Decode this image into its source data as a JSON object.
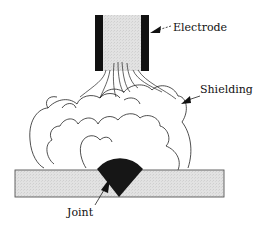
{
  "diagram": {
    "type": "welding-process-schematic",
    "labels": {
      "electrode": "Electrode",
      "shielding": "Shielding",
      "joint": "Joint"
    },
    "colors": {
      "electrode_walls": "#111111",
      "electrode_core": "#d8d8d8",
      "plate_fill": "#e4e4e4",
      "plate_stroke": "#555555",
      "weld_bead": "#161616",
      "lines": "#222222",
      "background": "#ffffff"
    }
  }
}
